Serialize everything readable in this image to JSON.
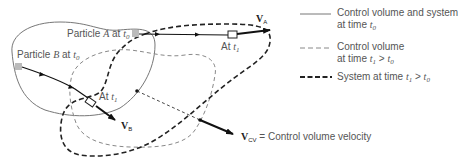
{
  "figure": {
    "particle_a_label": {
      "prefix": "Particle ",
      "name": "A",
      "mid": " at ",
      "time": "t",
      "sub": "0"
    },
    "particle_b_label": {
      "prefix": "Particle ",
      "name": "B",
      "mid": " at ",
      "time": "t",
      "sub": "0"
    },
    "at_t1_a": {
      "prefix": "At ",
      "time": "t",
      "sub": "1"
    },
    "at_t1_b": {
      "prefix": "At ",
      "time": "t",
      "sub": "1"
    },
    "velocity_a": {
      "symbol": "V",
      "sub": "A"
    },
    "velocity_b": {
      "symbol": "V",
      "sub": "B"
    },
    "velocity_cv": {
      "symbol": "V",
      "sub": "CV",
      "description": " = Control volume velocity"
    }
  },
  "legend": {
    "items": [
      {
        "style": "solid-thin",
        "line1": "Control volume and system",
        "line2_prefix": "at time ",
        "line2_time": "t",
        "line2_sub": "0",
        "line2_rel": "",
        "line2_time2": "",
        "line2_sub2": ""
      },
      {
        "style": "dashed-thin",
        "line1": "Control volume",
        "line2_prefix": "at time ",
        "line2_time": "t",
        "line2_sub": "1",
        "line2_rel": " > ",
        "line2_time2": "t",
        "line2_sub2": "0"
      },
      {
        "style": "dashed-thick",
        "line1": "System at time ",
        "line1_time": "t",
        "line1_sub": "1",
        "line1_rel": " > ",
        "line1_time2": "t",
        "line1_sub2": "0"
      }
    ]
  },
  "colors": {
    "cv_t0": "#777777",
    "cv_t1": "#888888",
    "system_t1": "#222222",
    "particle_marker": "#bbbbbb",
    "arrow": "#111111"
  }
}
